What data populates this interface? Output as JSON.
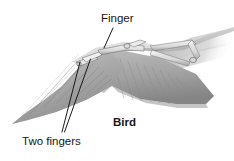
{
  "figure": {
    "background_color": "#ffffff",
    "labels": {
      "finger": "Finger",
      "two_fingers": "Two fingers",
      "organism": "Bird"
    },
    "colors": {
      "label_text": "#161616",
      "leader_line": "#1a1a1a",
      "wing_light": "#d6d6d6",
      "wing_mid": "#b4b4b4",
      "wing_dark": "#8f8f8f",
      "wing_darkest": "#6f6f6f",
      "bone_highlight": "#f2f2f2",
      "bone_outline": "#5a5a5a"
    },
    "leader_lines": [
      {
        "name": "finger-leader",
        "x1": 113,
        "y1": 28,
        "x2": 104,
        "y2": 48
      },
      {
        "name": "two-fingers-leader-a",
        "x1": 62,
        "y1": 132,
        "x2": 80,
        "y2": 62
      },
      {
        "name": "two-fingers-leader-b",
        "x1": 64,
        "y1": 132,
        "x2": 90,
        "y2": 59
      }
    ]
  }
}
